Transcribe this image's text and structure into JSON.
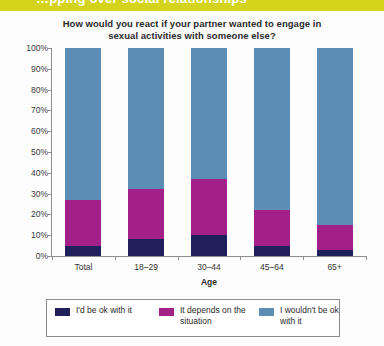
{
  "banner": {
    "text": "…pping over social relationships",
    "color": "#d4d41c"
  },
  "chart_data": {
    "type": "bar",
    "stacked": true,
    "title": "How would you react if your partner wanted to engage in sexual activities with someone else?",
    "title_line1": "How would you react if your partner wanted to engage in",
    "title_line2": "sexual activities with someone else?",
    "xlabel": "Age",
    "ylabel": "",
    "ylim": [
      0,
      100
    ],
    "ytick_labels": [
      "0%",
      "10%",
      "20%",
      "30%",
      "40%",
      "50%",
      "60%",
      "70%",
      "80%",
      "90%",
      "100%"
    ],
    "ytick_values": [
      0,
      10,
      20,
      30,
      40,
      50,
      60,
      70,
      80,
      90,
      100
    ],
    "grid": false,
    "legend_position": "bottom",
    "categories": [
      "Total",
      "18–29",
      "30–44",
      "45–64",
      "65+"
    ],
    "series": [
      {
        "name": "I'd be ok with it",
        "color": "#1f1f5c",
        "values": [
          5,
          8,
          10,
          5,
          3
        ]
      },
      {
        "name": "It depends on the situation",
        "color": "#a32089",
        "values": [
          22,
          24,
          27,
          17,
          12
        ]
      },
      {
        "name": "I wouldn't be ok with it",
        "color": "#5b8db5",
        "values": [
          73,
          68,
          63,
          78,
          85
        ]
      }
    ]
  }
}
